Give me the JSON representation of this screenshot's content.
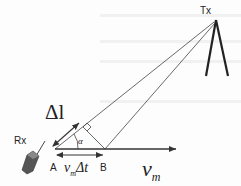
{
  "diagram": {
    "transmitter_label": "Tx",
    "receiver_label": "Rx",
    "point_a_label": "A",
    "point_b_label": "B",
    "delta_l_label": "Δl",
    "alpha_label": "α",
    "displacement_label": {
      "v": "v",
      "sub": "m",
      "rest": "Δt"
    },
    "velocity_label": {
      "v": "v",
      "sub": "m"
    },
    "colors": {
      "lines": "#333333",
      "device": "#555555"
    }
  }
}
